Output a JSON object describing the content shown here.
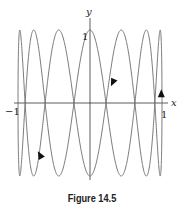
{
  "chart_data": {
    "type": "line",
    "subtype": "parametric",
    "title": "",
    "caption": "Figure 14.5",
    "xlabel": "x",
    "ylabel": "y",
    "tick_labels": {
      "x_min": "−1",
      "x_max": "1",
      "y_max": "1"
    },
    "xlim": [
      -1,
      1
    ],
    "ylim": [
      -1,
      1
    ],
    "grid": false,
    "legend": null,
    "curve": {
      "description": "Lissajous-type closed parametric curve with 7 peaks at y=1 and 7 troughs at y=-1, bounded by |x|<=1, |y|<=1",
      "x_of_t": "cos(t)",
      "y_of_t": "sin(7t)",
      "t_range": [
        0,
        6.2832
      ],
      "direction_arrows": [
        {
          "x": 0.99,
          "y": 0.12,
          "direction": "up"
        },
        {
          "x": 0.32,
          "y": 0.29,
          "direction": "down-left"
        },
        {
          "x": -0.69,
          "y": -0.72,
          "direction": "up-left"
        }
      ],
      "color": "#6a6a6a"
    }
  }
}
